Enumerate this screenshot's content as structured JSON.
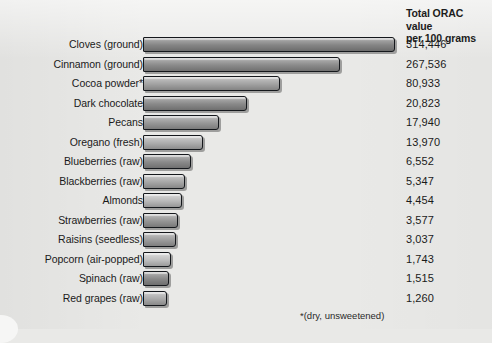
{
  "header": {
    "line1": "Total ORAC value",
    "line2": "per 100 grams"
  },
  "footnote": "*(dry, unsweetened)",
  "colors": {
    "background": "#e9e9e7",
    "bar_fill": "#9a9a9a",
    "bar_outline": "#15181c",
    "text": "#1a1a1a"
  },
  "chart_data": {
    "type": "bar",
    "orientation": "horizontal",
    "title": "",
    "xlabel": "",
    "ylabel": "",
    "value_header": "Total ORAC value per 100 grams",
    "grid": false,
    "legend": "none",
    "note": "Bar lengths are visually compressed, not linearly proportional to values",
    "categories": [
      "Cloves (ground)",
      "Cinnamon (ground)",
      "Cocoa powder*",
      "Dark chocolate",
      "Pecans",
      "Oregano (fresh)",
      "Blueberries (raw)",
      "Blackberries (raw)",
      "Almonds",
      "Strawberries (raw)",
      "Raisins (seedless)",
      "Popcorn (air-popped)",
      "Spinach (raw)",
      "Red grapes (raw)"
    ],
    "values": [
      314446,
      267536,
      80933,
      20823,
      17940,
      13970,
      6552,
      5347,
      4454,
      3577,
      3037,
      1743,
      1515,
      1260
    ],
    "value_labels": [
      "314,446",
      "267,536",
      "80,933",
      "20,823",
      "17,940",
      "13,970",
      "6,552",
      "5,347",
      "4,454",
      "3,577",
      "3,037",
      "1,743",
      "1,515",
      "1,260"
    ],
    "bar_pixel_lengths": [
      252,
      197,
      137,
      104,
      76,
      60,
      48,
      42,
      39,
      35,
      33,
      28,
      26,
      24
    ],
    "bar_shades": [
      "#8a8a8a",
      "#909090",
      "#a8a8a8",
      "#8e8e8e",
      "#9d9d9d",
      "#b4b4b4",
      "#8f8f8f",
      "#adadad",
      "#c0c0c0",
      "#9b9b9b",
      "#a2a2a2",
      "#c6c6c6",
      "#8d8d8d",
      "#b0b0b0"
    ],
    "row_tops": [
      36,
      55.5,
      75,
      94.5,
      114,
      133.5,
      153,
      172.5,
      192,
      211.5,
      231,
      250.5,
      270,
      289.5
    ]
  }
}
